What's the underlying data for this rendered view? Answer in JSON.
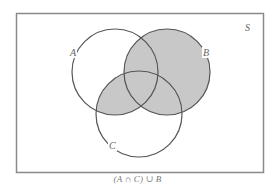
{
  "diagram": {
    "type": "venn",
    "universe_label": "S",
    "caption": "(A ∩ C) ∪ B",
    "shaded_region": "(A ∩ C) ∪ B",
    "colors": {
      "background": "#ffffff",
      "border": "#8a8a8a",
      "stroke": "#555555",
      "shade": "#c8c8c8",
      "label": "#666666"
    },
    "sets": [
      {
        "id": "A",
        "label": "A",
        "shaded": false
      },
      {
        "id": "B",
        "label": "B",
        "shaded": true
      },
      {
        "id": "C",
        "label": "C",
        "shaded": false
      }
    ],
    "shaded_intersections": [
      "A∩C",
      "B"
    ]
  }
}
